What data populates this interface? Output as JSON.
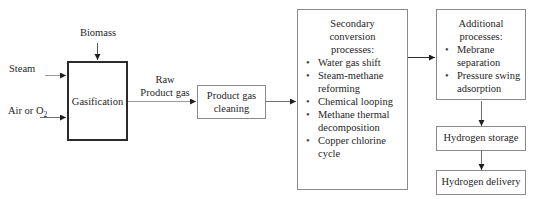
{
  "diagram": {
    "title_text": "Biomass gasification to hydrogen process flow",
    "inputs": {
      "biomass": "Biomass",
      "steam": "Steam",
      "air_or_o2_prefix": "Air or O",
      "air_or_o2_sub": "2"
    },
    "streams": {
      "raw_product_gas_line1": "Raw",
      "raw_product_gas_line2": "Product gas"
    },
    "boxes": {
      "gasification": {
        "label": "Gasification"
      },
      "product_gas_cleaning": {
        "line1": "Product gas",
        "line2": "cleaning"
      },
      "secondary_conversion": {
        "title_line1": "Secondary",
        "title_line2": "conversion",
        "title_line3": "processes:",
        "items": [
          "Water gas shift",
          "Steam-methane reforming",
          "Chemical looping",
          "Methane thermal decomposition",
          "Copper chlorine cycle"
        ]
      },
      "additional_processes": {
        "title_line1": "Additional",
        "title_line2": "processes:",
        "items": [
          "Mebrane separation",
          "Pressure swing adsorption"
        ]
      },
      "hydrogen_storage": {
        "label": "Hydrogen storage"
      },
      "hydrogen_delivery": {
        "label": "Hydrogen delivery"
      }
    },
    "colors": {
      "background": "#ffffff",
      "box_border": "#8a8a8a",
      "box_border_emphasis": "#2b2b2b",
      "text": "#262626",
      "arrow": "#6f6f6f",
      "arrow_dark": "#2b2b2b"
    },
    "bullet_glyph": "•"
  }
}
